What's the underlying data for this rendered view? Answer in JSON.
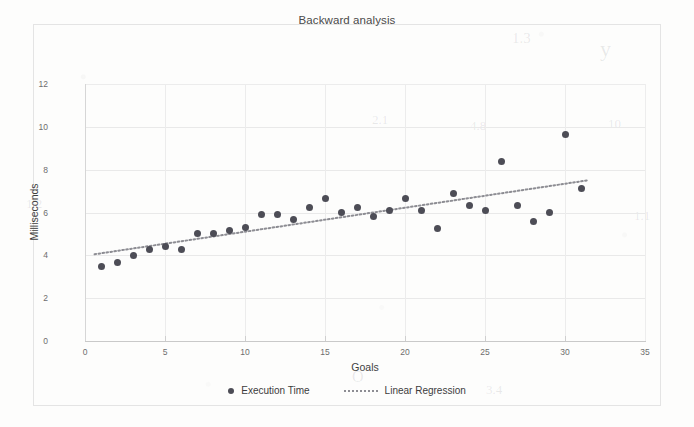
{
  "chart_data": {
    "type": "scatter",
    "title": "Backward analysis",
    "xlabel": "Goals",
    "ylabel": "Milliseconds",
    "xlim": [
      0,
      35
    ],
    "ylim": [
      0,
      12
    ],
    "xticks": [
      0,
      5,
      10,
      15,
      20,
      25,
      30,
      35
    ],
    "yticks": [
      0,
      2,
      4,
      6,
      8,
      10,
      12
    ],
    "grid": true,
    "legend_position": "bottom",
    "marker_color": "#4d4d56",
    "trendline_color": "#8d8d93",
    "series": [
      {
        "name": "Execution Time",
        "type": "scatter",
        "x": [
          1,
          2,
          3,
          4,
          5,
          6,
          7,
          8,
          9,
          10,
          11,
          12,
          13,
          14,
          15,
          16,
          17,
          18,
          19,
          20,
          21,
          22,
          23,
          24,
          25,
          26,
          27,
          28,
          29,
          30,
          31
        ],
        "values": [
          3.5,
          3.65,
          4.0,
          4.25,
          4.4,
          4.25,
          5.0,
          5.0,
          5.15,
          5.3,
          5.9,
          5.9,
          5.65,
          6.25,
          6.65,
          6.0,
          6.25,
          5.8,
          6.1,
          6.65,
          6.1,
          5.25,
          6.9,
          6.35,
          6.1,
          8.4,
          6.35,
          5.6,
          6.0,
          9.65,
          7.1
        ]
      },
      {
        "name": "Linear Regression",
        "type": "line",
        "style": "dotted",
        "x": [
          0.6,
          31.4
        ],
        "values": [
          4.05,
          7.5
        ]
      }
    ]
  },
  "chart": {
    "title": "Backward analysis",
    "y_axis_title": "Milliseconds",
    "x_axis_title": "Goals",
    "y_tick_labels": [
      "12",
      "10",
      "8",
      "6",
      "4",
      "2",
      "0"
    ],
    "x_tick_labels": [
      "0",
      "5",
      "10",
      "15",
      "20",
      "25",
      "30",
      "35"
    ]
  },
  "legend": {
    "items": [
      {
        "label": "Execution Time",
        "marker": "dot-marker-icon",
        "color": "#4d4d56"
      },
      {
        "label": "Linear Regression",
        "marker": "dotted-line-icon",
        "color": "#8d8d93"
      }
    ]
  },
  "background_artifacts": {
    "ghost_texts": [
      "1.3",
      "y",
      "2.1",
      "4.8",
      "10",
      "1.2",
      "1.1",
      "O",
      "3.4"
    ]
  }
}
